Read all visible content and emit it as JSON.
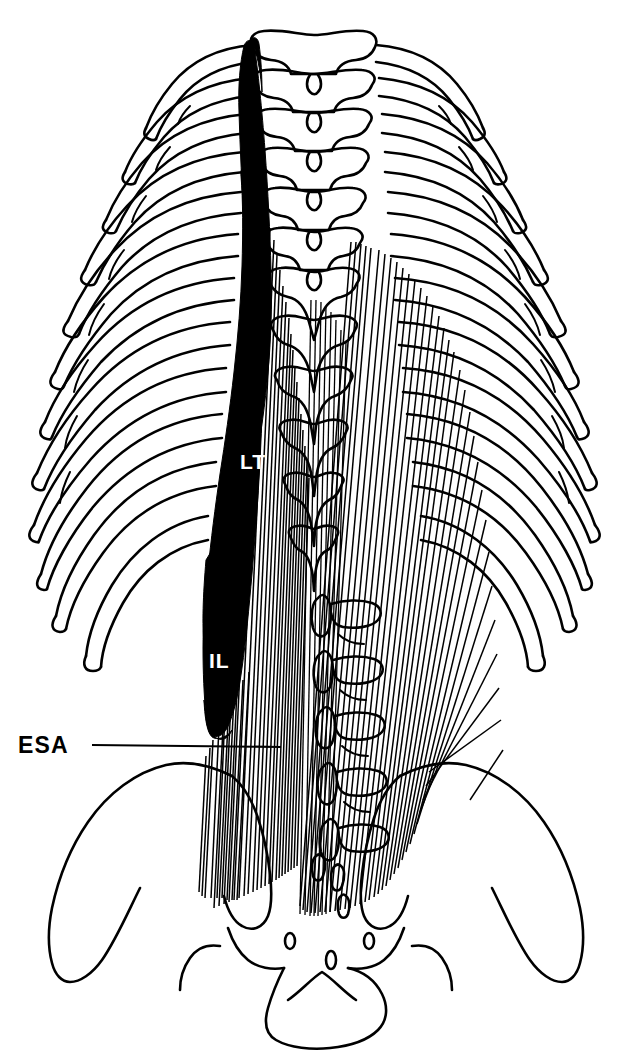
{
  "figure": {
    "background_color": "#ffffff",
    "ink_color": "#000000",
    "width": 627,
    "height": 1057
  },
  "labels": {
    "esa": {
      "text": "ESA",
      "meaning": "erector spinae aponeurosis",
      "color": "#000000",
      "x": 18,
      "y": 753,
      "leader_from_x": 92,
      "leader_to_x": 281,
      "leader_y": 745
    },
    "lt": {
      "text": "LT",
      "meaning": "longissimus thoracis",
      "color": "#ffffff",
      "x": 240,
      "y": 469
    },
    "il": {
      "text": "IL",
      "meaning": "iliocostalis lumborum",
      "color": "#ffffff",
      "x": 209,
      "y": 668
    }
  },
  "structures": [
    {
      "name": "rib-cage-left",
      "kind": "bone",
      "count": 12
    },
    {
      "name": "rib-cage-right",
      "kind": "bone",
      "count": 12
    },
    {
      "name": "thoracic-vertebrae",
      "kind": "bone",
      "count": 9
    },
    {
      "name": "lumbar-vertebrae",
      "kind": "bone",
      "count": 5
    },
    {
      "name": "sacrum",
      "kind": "bone",
      "count": 1
    },
    {
      "name": "ilium-left",
      "kind": "bone",
      "count": 1
    },
    {
      "name": "ilium-right",
      "kind": "bone",
      "count": 1
    },
    {
      "name": "longissimus-thoracis-muscle",
      "kind": "muscle",
      "fill": "#000000"
    },
    {
      "name": "iliocostalis-lumborum-muscle",
      "kind": "muscle",
      "fill": "#000000"
    },
    {
      "name": "erector-spinae-aponeurosis",
      "kind": "aponeurosis",
      "fill": "striated"
    }
  ],
  "caption": ""
}
